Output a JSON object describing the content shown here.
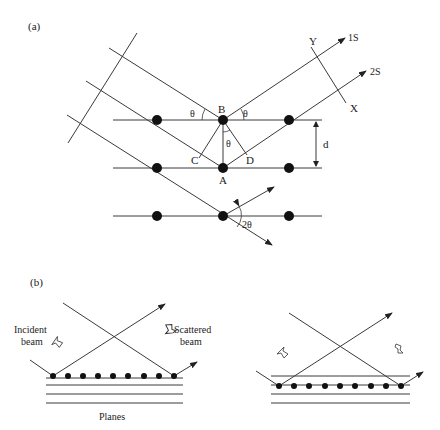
{
  "figure": {
    "panel_a": {
      "label": "(a)",
      "points": {
        "B": "B",
        "A": "A",
        "C": "C",
        "D": "D",
        "X": "X",
        "Y": "Y"
      },
      "angles": {
        "theta_left": "θ",
        "theta_right": "θ",
        "theta_center": "θ",
        "two_theta": "2θ"
      },
      "spacing_label": "d",
      "rays": {
        "ray1": "1S",
        "ray2": "2S"
      }
    },
    "panel_b": {
      "label": "(b)",
      "incident_label_line1": "Incident",
      "incident_label_line2": "beam",
      "scattered_label_line1": "Scattered",
      "scattered_label_line2": "beam",
      "planes_label": "Planes"
    }
  }
}
